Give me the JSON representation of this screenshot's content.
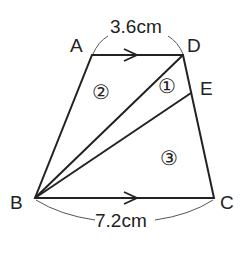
{
  "diagram": {
    "points": {
      "A": {
        "label": "A",
        "x": 92,
        "y": 55
      },
      "D": {
        "label": "D",
        "x": 183,
        "y": 55
      },
      "E": {
        "label": "E",
        "x": 191,
        "y": 93
      },
      "B": {
        "label": "B",
        "x": 35,
        "y": 198
      },
      "C": {
        "label": "C",
        "x": 214,
        "y": 198
      }
    },
    "top_length": "3.6cm",
    "bottom_length": "7.2cm",
    "regions": [
      "②",
      "①",
      "③"
    ],
    "line_color": "#222222"
  }
}
